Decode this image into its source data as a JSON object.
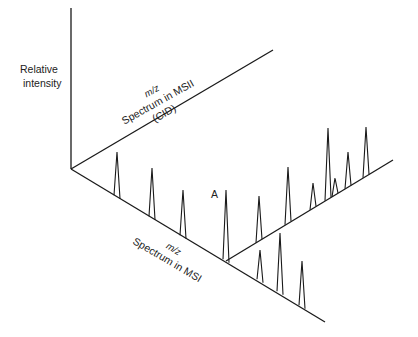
{
  "diagram": {
    "axes": {
      "y_label_line1": "Relative",
      "y_label_line2": "intensity",
      "msii_mz": "m/z",
      "msii_line1": "Spectrum in MSII",
      "msii_line2": "(CID)",
      "msi_mz": "m/z",
      "msi_line1": "Spectrum in MSI"
    },
    "peak_label": "A",
    "msi_peaks": [
      {
        "x": 117,
        "base": 197,
        "tip": 152
      },
      {
        "x": 152,
        "base": 218,
        "tip": 168
      },
      {
        "x": 183,
        "base": 237,
        "tip": 190
      },
      {
        "x": 226,
        "base": 261,
        "tip": 190,
        "label": "A"
      },
      {
        "x": 260,
        "base": 281,
        "tip": 250
      },
      {
        "x": 280,
        "base": 293,
        "tip": 233
      },
      {
        "x": 302,
        "base": 307,
        "tip": 261
      }
    ],
    "msii_peaks": [
      {
        "x": 259,
        "base": 241,
        "tip": 196
      },
      {
        "x": 288,
        "base": 223,
        "tip": 167
      },
      {
        "x": 313,
        "base": 208,
        "tip": 183
      },
      {
        "x": 328,
        "base": 199,
        "tip": 128
      },
      {
        "x": 335,
        "base": 195,
        "tip": 178
      },
      {
        "x": 348,
        "base": 187,
        "tip": 152
      },
      {
        "x": 366,
        "base": 176,
        "tip": 127
      }
    ],
    "colors": {
      "ink": "#1a1a1a",
      "background": "#ffffff"
    }
  }
}
